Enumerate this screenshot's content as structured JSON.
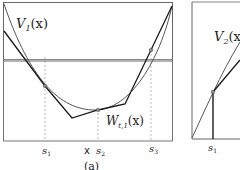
{
  "figure": {
    "panel_a": {
      "curve_label": "V",
      "curve_label_sub": "1",
      "curve_label_arg": "(x)",
      "approx_label": "W",
      "approx_label_sub": "t,1",
      "approx_label_arg": "(x)",
      "ticks": [
        {
          "name": "s",
          "sub": "1"
        },
        {
          "name": "s",
          "sub": "2"
        },
        {
          "name": "s",
          "sub": "3"
        }
      ],
      "marker": "x",
      "caption": "(a)"
    },
    "panel_b": {
      "curve_label": "V",
      "curve_label_sub": "2",
      "curve_label_arg": "(x)",
      "ticks": [
        {
          "name": "s",
          "sub": "1"
        }
      ]
    },
    "colors": {
      "axis": "#555555",
      "curve": "#555555",
      "approx": "#1a1a1a",
      "guide": "#999999"
    }
  }
}
